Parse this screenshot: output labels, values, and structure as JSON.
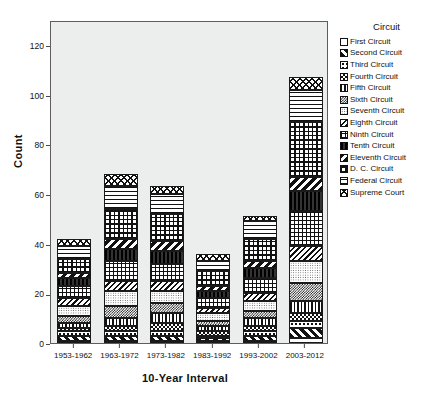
{
  "chart_data": {
    "type": "bar",
    "subtype": "stacked-bar",
    "title": "",
    "xlabel": "10-Year Interval",
    "ylabel": "Count",
    "ylim": [
      0,
      130
    ],
    "yticks": [
      0,
      20,
      40,
      60,
      80,
      100,
      120
    ],
    "grid": false,
    "legend_position": "right",
    "legend_title": "Circuit",
    "categories": [
      "1953-1962",
      "1963-1972",
      "1973-1982",
      "1983-1992",
      "1993-2002",
      "2003-2012"
    ],
    "totals": [
      42,
      68,
      63,
      36,
      51,
      107
    ],
    "series": [
      {
        "name": "First Circuit",
        "pattern": "solid",
        "values": [
          1,
          1,
          1,
          1,
          1,
          2
        ]
      },
      {
        "name": "Second Circuit",
        "pattern": "diag-heavy",
        "values": [
          2,
          2,
          2,
          1,
          2,
          4
        ]
      },
      {
        "name": "Third Circuit",
        "pattern": "dots-sparse",
        "values": [
          2,
          2,
          2,
          1,
          2,
          3
        ]
      },
      {
        "name": "Fourth Circuit",
        "pattern": "checker",
        "values": [
          1,
          2,
          3,
          2,
          2,
          3
        ]
      },
      {
        "name": "Fifth Circuit",
        "pattern": "vert",
        "values": [
          2,
          3,
          4,
          2,
          3,
          5
        ]
      },
      {
        "name": "Sixth Circuit",
        "pattern": "checker-fine",
        "values": [
          3,
          5,
          4,
          2,
          3,
          7
        ]
      },
      {
        "name": "Seventh Circuit",
        "pattern": "dots-fine",
        "values": [
          4,
          6,
          5,
          3,
          4,
          9
        ]
      },
      {
        "name": "Eighth Circuit",
        "pattern": "diag-back",
        "values": [
          3,
          4,
          4,
          2,
          3,
          6
        ]
      },
      {
        "name": "Ninth Circuit",
        "pattern": "plus",
        "values": [
          5,
          8,
          7,
          4,
          6,
          14
        ]
      },
      {
        "name": "Tenth Circuit",
        "pattern": "dark",
        "values": [
          3,
          5,
          5,
          3,
          4,
          8
        ]
      },
      {
        "name": "Eleventh Circuit",
        "pattern": "diag-back-heavy",
        "values": [
          2,
          4,
          4,
          2,
          3,
          6
        ]
      },
      {
        "name": "D. C. Circuit",
        "pattern": "grid-bold",
        "values": [
          6,
          12,
          11,
          6,
          9,
          22
        ]
      },
      {
        "name": "Federal Circuit",
        "pattern": "horiz",
        "values": [
          5,
          9,
          8,
          4,
          7,
          13
        ]
      },
      {
        "name": "Supreme Court",
        "pattern": "cross",
        "values": [
          3,
          5,
          3,
          3,
          2,
          5
        ]
      }
    ]
  },
  "legend": {
    "title": "Circuit",
    "items": [
      {
        "label": "First Circuit",
        "pattern": "solid"
      },
      {
        "label": "Second Circuit",
        "pattern": "diag-heavy"
      },
      {
        "label": "Third Circuit",
        "pattern": "dots-sparse"
      },
      {
        "label": "Fourth Circuit",
        "pattern": "checker"
      },
      {
        "label": "Fifth Circuit",
        "pattern": "vert"
      },
      {
        "label": "Sixth Circuit",
        "pattern": "checker-fine"
      },
      {
        "label": "Seventh Circuit",
        "pattern": "dots-fine"
      },
      {
        "label": "Eighth Circuit",
        "pattern": "diag-back"
      },
      {
        "label": "Ninth Circuit",
        "pattern": "plus"
      },
      {
        "label": "Tenth Circuit",
        "pattern": "dark"
      },
      {
        "label": "Eleventh Circuit",
        "pattern": "diag-back-heavy"
      },
      {
        "label": "D. C. Circuit",
        "pattern": "grid-bold"
      },
      {
        "label": "Federal Circuit",
        "pattern": "horiz"
      },
      {
        "label": "Supreme Court",
        "pattern": "cross"
      }
    ]
  },
  "colors": {
    "panel_background": "#eceded",
    "panel_border": "#5d5d5d",
    "ink": "#111111",
    "page_background": "#ffffff"
  }
}
